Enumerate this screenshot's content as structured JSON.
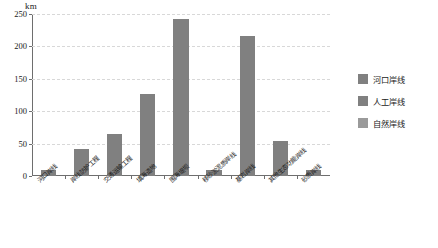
{
  "chart_data": {
    "type": "bar",
    "title": "",
    "xlabel": "",
    "ylabel": "km",
    "ylim": [
      0,
      250
    ],
    "yticks": [
      0,
      50,
      100,
      150,
      200,
      250
    ],
    "grid": true,
    "legend_position": "right",
    "categories": [
      "河口岸线",
      "岸线防护工程",
      "交通运输工程",
      "填海造地",
      "围海堤坝",
      "移砂淤泥质岸线",
      "基岩岸线",
      "其他生态功能岸线",
      "砂质岸线"
    ],
    "values": [
      10,
      42,
      65,
      127,
      243,
      10,
      216,
      54,
      10
    ],
    "bar_color": "#808080",
    "legend": [
      {
        "label": "河口岸线",
        "color": "#808080"
      },
      {
        "label": "人工岸线",
        "color": "#808080"
      },
      {
        "label": "自然岸线",
        "color": "#9a9a9a"
      }
    ]
  },
  "axis": {
    "unit": "km",
    "tick_labels": [
      "250",
      "200",
      "150",
      "100",
      "50",
      "0"
    ]
  }
}
